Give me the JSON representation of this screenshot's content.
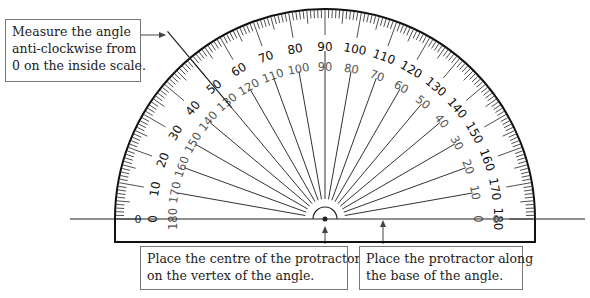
{
  "diagram": {
    "type": "protractor",
    "center": [
      325,
      219
    ],
    "outer_radius": 210,
    "colors": {
      "line": "#222222",
      "inner_text": "#555555",
      "outer_text": "#111111",
      "box_border": "#777777"
    },
    "outer_scale": {
      "labels": [
        "0",
        "10",
        "20",
        "30",
        "40",
        "50",
        "60",
        "70",
        "80",
        "90",
        "100",
        "110",
        "120",
        "130",
        "140",
        "150",
        "160",
        "170",
        "180"
      ],
      "direction": "left-to-right"
    },
    "inner_scale": {
      "labels": [
        "180",
        "170",
        "160",
        "150",
        "140",
        "130",
        "120",
        "110",
        "100",
        "90",
        "80",
        "70",
        "60",
        "50",
        "40",
        "30",
        "20",
        "10",
        "0"
      ],
      "direction": "left-to-right"
    }
  },
  "callouts": {
    "measure": {
      "lines": [
        "Measure the angle",
        "anti-clockwise from",
        "0 on the inside scale."
      ]
    },
    "centre": {
      "lines": [
        "Place the centre of the protractor",
        "on the vertex of the angle."
      ]
    },
    "base": {
      "lines": [
        "Place the protractor along",
        "the base of the angle."
      ]
    }
  }
}
